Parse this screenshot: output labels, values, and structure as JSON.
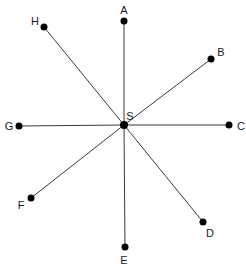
{
  "diagram": {
    "type": "star-of-rays",
    "center": {
      "label": "S",
      "x": 124,
      "y": 125,
      "label_x": 130,
      "label_y": 116
    },
    "points": [
      {
        "label": "A",
        "x": 124,
        "y": 21,
        "label_x": 124,
        "label_y": 10
      },
      {
        "label": "B",
        "x": 211,
        "y": 59,
        "label_x": 221,
        "label_y": 52
      },
      {
        "label": "C",
        "x": 229,
        "y": 125,
        "label_x": 241,
        "label_y": 126
      },
      {
        "label": "D",
        "x": 203,
        "y": 222,
        "label_x": 210,
        "label_y": 233
      },
      {
        "label": "E",
        "x": 125,
        "y": 247,
        "label_x": 124,
        "label_y": 260
      },
      {
        "label": "F",
        "x": 31,
        "y": 198,
        "label_x": 21,
        "label_y": 205
      },
      {
        "label": "G",
        "x": 19,
        "y": 126,
        "label_x": 9,
        "label_y": 126
      },
      {
        "label": "H",
        "x": 44,
        "y": 27,
        "label_x": 35,
        "label_y": 21
      }
    ],
    "colors": {
      "line": "#3a3a3a",
      "point": "#000000",
      "label": "#1a1a1a"
    }
  }
}
